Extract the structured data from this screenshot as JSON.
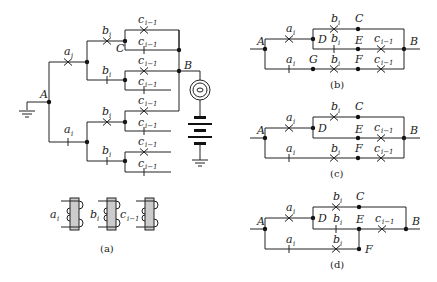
{
  "figure": {
    "panel_a": {
      "caption": "(a)",
      "nodes": {
        "A": "A",
        "B": "B",
        "C": "C"
      },
      "contacts": {
        "ai": "a",
        "ai_sub": "i",
        "ai_prime": "a",
        "ai_prime_sub": "i",
        "bi": "b",
        "bi_sub": "i",
        "bi_prime": "b",
        "bi_prime_sub": "i",
        "ci1": "c",
        "ci1_sub": "i−1",
        "ci1_prime": "c",
        "ci1_prime_sub": "i−1"
      },
      "relays": [
        {
          "label": "a",
          "sub": "i"
        },
        {
          "label": "b",
          "sub": "i"
        },
        {
          "label": "c",
          "sub": "i−1"
        }
      ]
    },
    "panel_b": {
      "caption": "(b)",
      "nodes": {
        "A": "A",
        "B": "B",
        "C": "C",
        "D": "D",
        "E": "E",
        "F": "F",
        "G": "G"
      }
    },
    "panel_c": {
      "caption": "(c)",
      "nodes": {
        "A": "A",
        "B": "B",
        "C": "C",
        "D": "D",
        "E": "E",
        "F": "F"
      }
    },
    "panel_d": {
      "caption": "(d)",
      "nodes": {
        "A": "A",
        "B": "B",
        "C": "C",
        "D": "D",
        "E": "E",
        "F": "F"
      }
    }
  }
}
